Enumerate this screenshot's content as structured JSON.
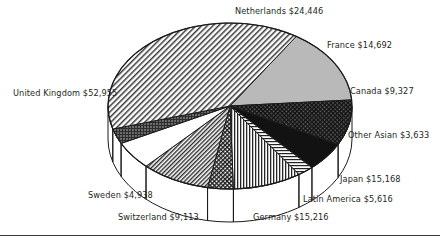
{
  "chart_data": {
    "type": "pie",
    "title": "",
    "subtitle": "",
    "xlabel": "",
    "ylabel": "",
    "legend_position": "callout-labels",
    "grid": false,
    "style": "3d-pie",
    "value_prefix": "$",
    "categories": [
      "Netherlands",
      "France",
      "Canada",
      "Other Asian",
      "Japan",
      "Latin America",
      "Germany",
      "Switzerland",
      "Sweden",
      "United Kingdom"
    ],
    "values": [
      24446,
      14692,
      9327,
      3633,
      15168,
      5616,
      15216,
      9113,
      4938,
      52955
    ],
    "slices": [
      {
        "name": "Netherlands",
        "value": 24446,
        "label": "Netherlands $24,446",
        "fill": "solid-gray",
        "start_deg": -57.1,
        "end_deg": -4.2
      },
      {
        "name": "France",
        "value": 14692,
        "label": "France $14,692",
        "fill": "fine-crosshatch-dark",
        "start_deg": -4.2,
        "end_deg": 27.6
      },
      {
        "name": "Canada",
        "value": 9327,
        "label": "Canada $9,327",
        "fill": "solid-black",
        "start_deg": 27.6,
        "end_deg": 47.8
      },
      {
        "name": "Other Asian",
        "value": 3633,
        "label": "Other Asian $3,633",
        "fill": "horizontal-lines",
        "start_deg": 47.8,
        "end_deg": 55.6
      },
      {
        "name": "Japan",
        "value": 15168,
        "label": "Japan $15,168",
        "fill": "vertical-lines",
        "start_deg": 55.6,
        "end_deg": 88.4
      },
      {
        "name": "Latin America",
        "value": 5616,
        "label": "Latin America $5,616",
        "fill": "diagonal-dense",
        "start_deg": 88.4,
        "end_deg": 100.6
      },
      {
        "name": "Germany",
        "value": 15216,
        "label": "Germany $15,216",
        "fill": "diagonal-medium",
        "start_deg": 100.6,
        "end_deg": 133.5
      },
      {
        "name": "Switzerland",
        "value": 9113,
        "label": "Switzerland $9,113",
        "fill": "white",
        "start_deg": 133.5,
        "end_deg": 153.2
      },
      {
        "name": "Sweden",
        "value": 4938,
        "label": "Sweden $4,938",
        "fill": "dark-dotted",
        "start_deg": 153.2,
        "end_deg": 163.9
      },
      {
        "name": "United Kingdom",
        "value": 52955,
        "label": "United Kingdom $52,955",
        "fill": "diagonal-light",
        "start_deg": 163.9,
        "end_deg": 302.9
      }
    ],
    "colors": {
      "outline": "#1b1b1b",
      "solid_gray": "#b9b9b9",
      "solid_black": "#111111",
      "white": "#ffffff",
      "text": "#231f20",
      "baseline": "#3a3a3a"
    }
  },
  "labels": {
    "netherlands": "Netherlands $24,446",
    "france": "France $14,692",
    "canada": "Canada $9,327",
    "other_asian": "Other Asian $3,633",
    "japan": "Japan $15,168",
    "latin_america": "Latin America $5,616",
    "germany": "Germany $15,216",
    "switzerland": "Switzerland $9,113",
    "sweden": "Sweden $4,938",
    "united_kingdom": "United Kingdom $52,955"
  }
}
